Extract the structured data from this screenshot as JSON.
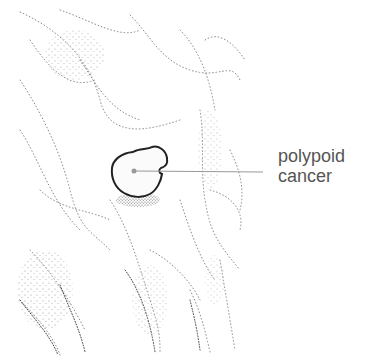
{
  "figure": {
    "label": {
      "line1": "polypoid",
      "line2": "cancer"
    },
    "colors": {
      "outline": "#222222",
      "leader_line": "#999999",
      "stipple": "#7a7a7a",
      "label_text": "#555555",
      "background": "#ffffff"
    }
  }
}
